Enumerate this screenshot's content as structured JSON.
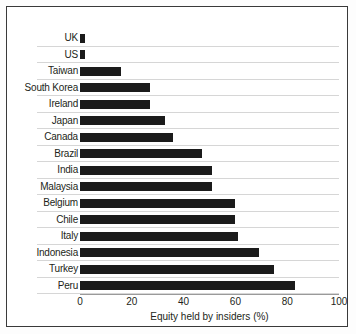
{
  "chart_data": {
    "type": "bar",
    "orientation": "horizontal",
    "title": "",
    "xlabel": "Equity held by insiders (%)",
    "ylabel": "",
    "xlim": [
      0,
      100
    ],
    "xticks": [
      0,
      20,
      40,
      60,
      80,
      100
    ],
    "xtick_labels": [
      "0",
      "20",
      "40",
      "60",
      "80",
      "100"
    ],
    "grid": true,
    "grid_axis": "y",
    "legend": false,
    "bar_color": "#1b1b1b",
    "categories": [
      "UK",
      "US",
      "Taiwan",
      "South Korea",
      "Ireland",
      "Japan",
      "Canada",
      "Brazil",
      "India",
      "Malaysia",
      "Belgium",
      "Chile",
      "Italy",
      "Indonesia",
      "Turkey",
      "Peru"
    ],
    "values": [
      2,
      2,
      16,
      27,
      27,
      33,
      36,
      47,
      51,
      51,
      60,
      60,
      61,
      69,
      75,
      83
    ]
  }
}
